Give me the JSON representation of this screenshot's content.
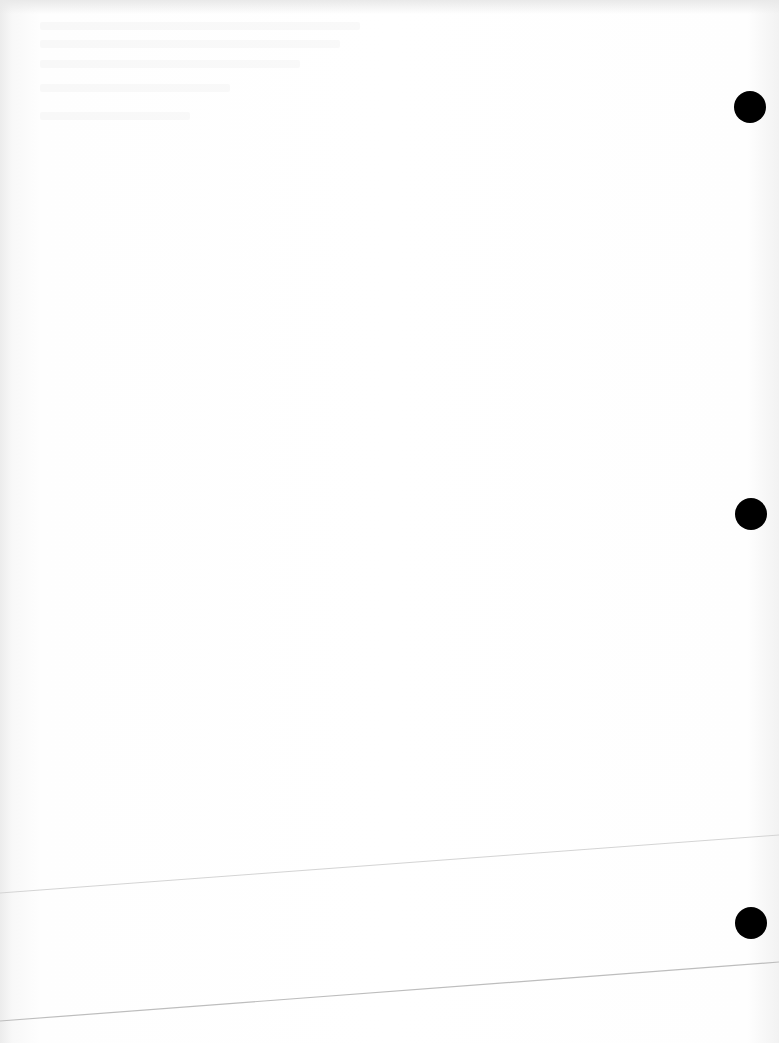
{
  "document": {
    "type": "scanned blank page",
    "text": "",
    "punch_holes": [
      {
        "cx": 750,
        "cy": 107,
        "r": 16
      },
      {
        "cx": 751,
        "cy": 514,
        "r": 16
      },
      {
        "cx": 751,
        "cy": 923,
        "r": 16
      }
    ],
    "fold_lines": [
      {
        "x1": 0,
        "y1": 893,
        "x2": 779,
        "y2": 835
      },
      {
        "x1": 0,
        "y1": 1021,
        "x2": 779,
        "y2": 962
      }
    ],
    "colors": {
      "paper": "#fdfdfd",
      "hole": "#000000",
      "line": "#cfcfcf"
    }
  }
}
